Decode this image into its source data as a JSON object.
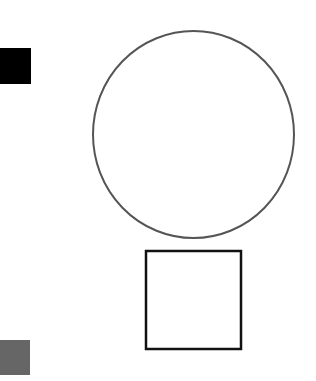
{
  "canvas": {
    "width": 316,
    "height": 381,
    "background": "#ffffff"
  },
  "shapes": [
    {
      "id": "black-square",
      "type": "rect",
      "x": 0,
      "y": 48,
      "width": 31,
      "height": 36,
      "fill": "#000000",
      "stroke": "none",
      "stroke_width": 0
    },
    {
      "id": "gray-square",
      "type": "rect",
      "x": 0,
      "y": 340,
      "width": 30,
      "height": 35,
      "fill": "#666666",
      "stroke": "none",
      "stroke_width": 0
    },
    {
      "id": "outlined-circle",
      "type": "ellipse",
      "cx": 193.5,
      "cy": 134.5,
      "rx": 100.5,
      "ry": 103.5,
      "fill": "none",
      "stroke": "#555555",
      "stroke_width": 2
    },
    {
      "id": "outlined-square",
      "type": "rect",
      "x": 146,
      "y": 251,
      "width": 95,
      "height": 98,
      "fill": "none",
      "stroke": "#111111",
      "stroke_width": 2.5
    }
  ]
}
